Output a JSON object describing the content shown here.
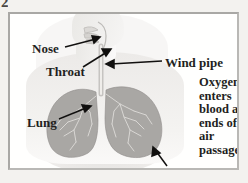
{
  "page": {
    "number": "2"
  },
  "figure": {
    "title_alt": "Human respiratory system diagram",
    "labels": {
      "nose": "Nose",
      "throat": "Throat",
      "wind_pipe": "Wind pipe",
      "lung": "Lung",
      "air_passages": "Air passages"
    },
    "callout": {
      "lines": [
        "Oxygen",
        "enters",
        "blood at",
        "ends of",
        "air",
        "passages"
      ]
    },
    "colors": {
      "page_background": "#f3f2ef",
      "panel_background": "#fffffe",
      "frame_border": "#b9b8b5",
      "body_silhouette": "#ecebe8",
      "lung_fill": "#a5a3a0",
      "bronchi_stroke": "#d8d6d3",
      "text": "#231f1d",
      "arrow": "#11100f"
    },
    "arrows": [
      {
        "name": "nose-arrow",
        "from": [
          55,
          33
        ],
        "to": [
          88,
          24
        ]
      },
      {
        "name": "throat-arrow",
        "from": [
          72,
          53
        ],
        "to": [
          99,
          36
        ]
      },
      {
        "name": "wind-pipe-arrow",
        "from": [
          152,
          47
        ],
        "to": [
          96,
          50
        ]
      },
      {
        "name": "lung-arrow",
        "from": [
          48,
          104
        ],
        "to": [
          79,
          92
        ]
      },
      {
        "name": "air-passages-arrow",
        "from": [
          157,
          152
        ],
        "to": [
          143,
          134
        ]
      }
    ]
  }
}
